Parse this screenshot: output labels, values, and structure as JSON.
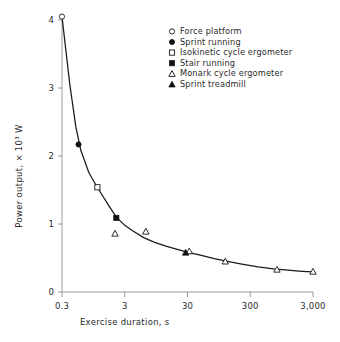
{
  "chart_data": {
    "type": "scatter",
    "title": "",
    "xlabel": "Exercise duration, s",
    "ylabel": "Power output, × 10³ W",
    "xscale": "log",
    "yscale": "linear",
    "xlim": [
      0.3,
      3000
    ],
    "ylim": [
      0,
      4
    ],
    "xticks": [
      0.3,
      3,
      30,
      300,
      3000
    ],
    "xticklabels": [
      "0.3",
      "3",
      "30",
      "300",
      "3,000"
    ],
    "yticks": [
      0,
      1,
      2,
      3,
      4
    ],
    "yticklabels": [
      "0",
      "1",
      "2",
      "3",
      "4"
    ],
    "grid": false,
    "legend_position": "top-right",
    "legend": [
      {
        "label": "Force platform",
        "marker": "open-circle"
      },
      {
        "label": "Sprint running",
        "marker": "filled-circle"
      },
      {
        "label": "Isokinetic cycle ergometer",
        "marker": "open-square"
      },
      {
        "label": "Stair running",
        "marker": "filled-square"
      },
      {
        "label": "Monark cycle ergometer",
        "marker": "open-triangle"
      },
      {
        "label": "Sprint treadmill",
        "marker": "filled-triangle"
      }
    ],
    "series": [
      {
        "name": "Force platform",
        "marker": "open-circle",
        "points": [
          {
            "x": 0.3,
            "y": 4.05
          }
        ]
      },
      {
        "name": "Sprint running",
        "marker": "filled-circle",
        "points": [
          {
            "x": 0.55,
            "y": 2.17
          }
        ]
      },
      {
        "name": "Isokinetic cycle ergometer",
        "marker": "open-square",
        "points": [
          {
            "x": 1.1,
            "y": 1.54
          }
        ]
      },
      {
        "name": "Stair running",
        "marker": "filled-square",
        "points": [
          {
            "x": 2.2,
            "y": 1.09
          }
        ]
      },
      {
        "name": "Monark cycle ergometer",
        "marker": "open-triangle",
        "points": [
          {
            "x": 2.1,
            "y": 0.86
          },
          {
            "x": 6.5,
            "y": 0.89
          },
          {
            "x": 32,
            "y": 0.6
          },
          {
            "x": 120,
            "y": 0.45
          },
          {
            "x": 800,
            "y": 0.33
          },
          {
            "x": 3000,
            "y": 0.3
          }
        ]
      },
      {
        "name": "Sprint treadmill",
        "marker": "filled-triangle",
        "points": [
          {
            "x": 28,
            "y": 0.58
          }
        ]
      }
    ],
    "fitted_curve": {
      "description": "Monotonic decreasing power-duration curve",
      "points": [
        {
          "x": 0.3,
          "y": 4.05
        },
        {
          "x": 0.4,
          "y": 3.05
        },
        {
          "x": 0.5,
          "y": 2.42
        },
        {
          "x": 0.6,
          "y": 2.08
        },
        {
          "x": 0.8,
          "y": 1.76
        },
        {
          "x": 1.0,
          "y": 1.6
        },
        {
          "x": 1.3,
          "y": 1.43
        },
        {
          "x": 1.7,
          "y": 1.26
        },
        {
          "x": 2.2,
          "y": 1.1
        },
        {
          "x": 3.0,
          "y": 0.98
        },
        {
          "x": 4.0,
          "y": 0.9
        },
        {
          "x": 6.0,
          "y": 0.8
        },
        {
          "x": 9.0,
          "y": 0.73
        },
        {
          "x": 14.0,
          "y": 0.67
        },
        {
          "x": 22.0,
          "y": 0.62
        },
        {
          "x": 32.0,
          "y": 0.58
        },
        {
          "x": 50.0,
          "y": 0.54
        },
        {
          "x": 80.0,
          "y": 0.49
        },
        {
          "x": 130.0,
          "y": 0.45
        },
        {
          "x": 220.0,
          "y": 0.41
        },
        {
          "x": 400.0,
          "y": 0.37
        },
        {
          "x": 700.0,
          "y": 0.34
        },
        {
          "x": 1200.0,
          "y": 0.32
        },
        {
          "x": 2000.0,
          "y": 0.305
        },
        {
          "x": 3000.0,
          "y": 0.295
        }
      ]
    }
  }
}
